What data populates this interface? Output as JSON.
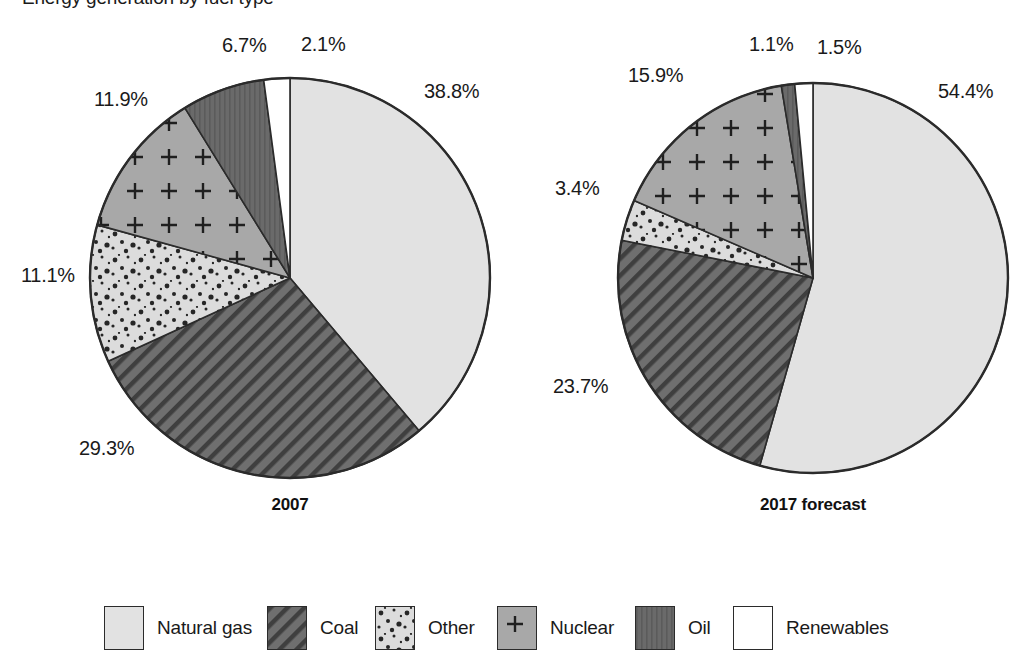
{
  "chart_data": {
    "type": "pie",
    "title": "Energy generation by fuel type",
    "xlabel": "",
    "ylabel": "",
    "legend_position": "bottom",
    "grid": false,
    "categories": [
      "Natural gas",
      "Coal",
      "Other",
      "Nuclear",
      "Oil",
      "Renewables"
    ],
    "unit": "%",
    "charts": [
      {
        "caption": "2007",
        "values": [
          38.8,
          29.3,
          11.1,
          11.9,
          6.7,
          2.1
        ],
        "labels": [
          "38.8%",
          "29.3%",
          "11.1%",
          "11.9%",
          "6.7%",
          "2.1%"
        ]
      },
      {
        "caption": "2017 forecast",
        "values": [
          54.4,
          23.7,
          3.4,
          15.9,
          1.1,
          1.5
        ],
        "labels": [
          "54.4%",
          "23.7%",
          "3.4%",
          "15.9%",
          "1.1%",
          "1.5%"
        ]
      }
    ],
    "series": [
      {
        "name": "2007",
        "values": [
          38.8,
          29.3,
          11.1,
          11.9,
          6.7,
          2.1
        ]
      },
      {
        "name": "2017 forecast",
        "values": [
          54.4,
          23.7,
          3.4,
          15.9,
          1.1,
          1.5
        ]
      }
    ]
  },
  "title": "Energy generation by fuel type",
  "pies": [
    {
      "caption": "2007",
      "cx": 290,
      "cy": 278,
      "r": 200,
      "slices": [
        {
          "key": "natural-gas",
          "label": "38.8%",
          "value": 38.8,
          "pattern": "solid-light",
          "fill": "#e2e2e2"
        },
        {
          "key": "coal",
          "label": "29.3%",
          "value": 29.3,
          "pattern": "diagonal",
          "fill": "#6f6f6f"
        },
        {
          "key": "other",
          "label": "11.1%",
          "value": 11.1,
          "pattern": "dots",
          "fill": "#dcdcdc"
        },
        {
          "key": "nuclear",
          "label": "11.9%",
          "value": 11.9,
          "pattern": "plus",
          "fill": "#a8a8a8"
        },
        {
          "key": "oil",
          "label": "6.7%",
          "value": 6.7,
          "pattern": "solid-dark",
          "fill": "#6a6a6a"
        },
        {
          "key": "renewables",
          "label": "2.1%",
          "value": 2.1,
          "pattern": "white",
          "fill": "#ffffff"
        }
      ],
      "label_positions": [
        {
          "label": "38.8%",
          "x": 424,
          "y": 80
        },
        {
          "label": "29.3%",
          "x": 79,
          "y": 437
        },
        {
          "label": "11.1%",
          "x": 21,
          "y": 264
        },
        {
          "label": "11.9%",
          "x": 94,
          "y": 88
        },
        {
          "label": "6.7%",
          "x": 222,
          "y": 34
        },
        {
          "label": "2.1%",
          "x": 301,
          "y": 33
        }
      ],
      "caption_box": {
        "x": 240,
        "y": 495,
        "w": 100
      }
    },
    {
      "caption": "2017 forecast",
      "cx": 813,
      "cy": 278,
      "r": 195,
      "slices": [
        {
          "key": "natural-gas",
          "label": "54.4%",
          "value": 54.4,
          "pattern": "solid-light",
          "fill": "#e2e2e2"
        },
        {
          "key": "coal",
          "label": "23.7%",
          "value": 23.7,
          "pattern": "diagonal",
          "fill": "#6f6f6f"
        },
        {
          "key": "other",
          "label": "3.4%",
          "value": 3.4,
          "pattern": "dots",
          "fill": "#dcdcdc"
        },
        {
          "key": "nuclear",
          "label": "15.9%",
          "value": 15.9,
          "pattern": "plus",
          "fill": "#a8a8a8"
        },
        {
          "key": "oil",
          "label": "1.1%",
          "value": 1.1,
          "pattern": "solid-dark",
          "fill": "#6a6a6a"
        },
        {
          "key": "renewables",
          "label": "1.5%",
          "value": 1.5,
          "pattern": "white",
          "fill": "#ffffff"
        }
      ],
      "label_positions": [
        {
          "label": "54.4%",
          "x": 938,
          "y": 80
        },
        {
          "label": "23.7%",
          "x": 553,
          "y": 375
        },
        {
          "label": "3.4%",
          "x": 555,
          "y": 177
        },
        {
          "label": "15.9%",
          "x": 628,
          "y": 64
        },
        {
          "label": "1.1%",
          "x": 749,
          "y": 33
        },
        {
          "label": "1.5%",
          "x": 817,
          "y": 36
        }
      ],
      "caption_box": {
        "x": 738,
        "y": 495,
        "w": 150
      }
    }
  ],
  "legend": {
    "items": [
      {
        "key": "natural-gas",
        "label": "Natural gas",
        "pattern": "solid-light",
        "fill": "#e2e2e2",
        "x": 104
      },
      {
        "key": "coal",
        "label": "Coal",
        "pattern": "diagonal",
        "fill": "#6f6f6f",
        "x": 267
      },
      {
        "key": "other",
        "label": "Other",
        "pattern": "dots",
        "fill": "#dcdcdc",
        "x": 375
      },
      {
        "key": "nuclear",
        "label": "Nuclear",
        "pattern": "plus",
        "fill": "#a8a8a8",
        "x": 497
      },
      {
        "key": "oil",
        "label": "Oil",
        "pattern": "solid-dark",
        "fill": "#6a6a6a",
        "x": 635
      },
      {
        "key": "renewables",
        "label": "Renewables",
        "pattern": "white",
        "fill": "#ffffff",
        "x": 733
      }
    ]
  },
  "colors": {
    "natural_gas": "#e2e2e2",
    "coal": "#6f6f6f",
    "other": "#dcdcdc",
    "nuclear": "#a8a8a8",
    "oil": "#6a6a6a",
    "renewables": "#ffffff",
    "outline": "#2b2b2b",
    "text": "#1a1a1a",
    "background": "#ffffff"
  }
}
